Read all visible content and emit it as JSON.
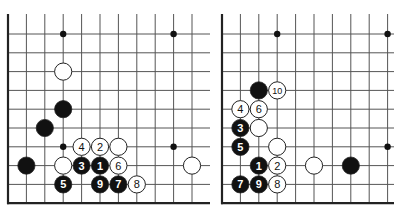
{
  "colors": {
    "background": "#ffffff",
    "grid": "#555555",
    "edge": "#222222",
    "black_stone": "#111111",
    "white_stone": "#ffffff",
    "stone_outline": "#222222",
    "star_point": "#111111"
  },
  "geometry": {
    "row_y0": 34,
    "row_step": 18.8,
    "rows": 10,
    "top_open_y": 14,
    "stone_r": 8.6,
    "star_r": 3.2
  },
  "boards": [
    {
      "name": "diagram-left",
      "x0": 8,
      "col_step": 18.4,
      "cols": 11,
      "right_extent": 210,
      "left_edge": true,
      "bottom_edge": true,
      "star_points": [
        [
          3,
          0
        ],
        [
          9,
          0
        ],
        [
          3,
          6
        ],
        [
          9,
          6
        ]
      ],
      "stones": [
        {
          "col": 3,
          "row": 2,
          "color": "white",
          "label": ""
        },
        {
          "col": 3,
          "row": 4,
          "color": "black",
          "label": ""
        },
        {
          "col": 2,
          "row": 5,
          "color": "black",
          "label": ""
        },
        {
          "col": 4,
          "row": 6,
          "color": "white",
          "label": "4"
        },
        {
          "col": 5,
          "row": 6,
          "color": "white",
          "label": "2"
        },
        {
          "col": 6,
          "row": 6,
          "color": "white",
          "label": ""
        },
        {
          "col": 1,
          "row": 7,
          "color": "black",
          "label": ""
        },
        {
          "col": 3,
          "row": 7,
          "color": "white",
          "label": ""
        },
        {
          "col": 4,
          "row": 7,
          "color": "black",
          "label": "3"
        },
        {
          "col": 5,
          "row": 7,
          "color": "black",
          "label": "1"
        },
        {
          "col": 6,
          "row": 7,
          "color": "white",
          "label": "6"
        },
        {
          "col": 10,
          "row": 7,
          "color": "white",
          "label": ""
        },
        {
          "col": 3,
          "row": 8,
          "color": "black",
          "label": "5"
        },
        {
          "col": 5,
          "row": 8,
          "color": "black",
          "label": "9"
        },
        {
          "col": 6,
          "row": 8,
          "color": "black",
          "label": "7"
        },
        {
          "col": 7,
          "row": 8,
          "color": "white",
          "label": "8"
        }
      ]
    },
    {
      "name": "diagram-right",
      "x0": 222,
      "col_step": 18.4,
      "cols": 10,
      "right_extent": 394,
      "left_edge": true,
      "bottom_edge": true,
      "star_points": [
        [
          3,
          0
        ],
        [
          9,
          0
        ],
        [
          9,
          6
        ]
      ],
      "stones": [
        {
          "col": 2,
          "row": 3,
          "color": "black",
          "label": ""
        },
        {
          "col": 3,
          "row": 3,
          "color": "white",
          "label": "10"
        },
        {
          "col": 1,
          "row": 4,
          "color": "white",
          "label": "4"
        },
        {
          "col": 2,
          "row": 4,
          "color": "white",
          "label": "6"
        },
        {
          "col": 1,
          "row": 5,
          "color": "black",
          "label": "3"
        },
        {
          "col": 2,
          "row": 5,
          "color": "white",
          "label": ""
        },
        {
          "col": 1,
          "row": 6,
          "color": "black",
          "label": "5"
        },
        {
          "col": 3,
          "row": 6,
          "color": "white",
          "label": ""
        },
        {
          "col": 2,
          "row": 7,
          "color": "black",
          "label": "1"
        },
        {
          "col": 3,
          "row": 7,
          "color": "white",
          "label": "2"
        },
        {
          "col": 5,
          "row": 7,
          "color": "white",
          "label": ""
        },
        {
          "col": 7,
          "row": 7,
          "color": "black",
          "label": ""
        },
        {
          "col": 1,
          "row": 8,
          "color": "black",
          "label": "7"
        },
        {
          "col": 2,
          "row": 8,
          "color": "black",
          "label": "9"
        },
        {
          "col": 3,
          "row": 8,
          "color": "white",
          "label": "8"
        }
      ]
    }
  ]
}
